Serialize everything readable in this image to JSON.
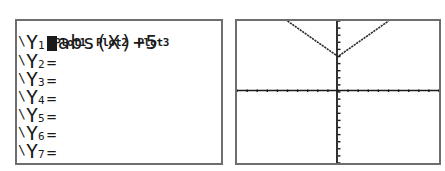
{
  "y_editor": {
    "plots": [
      "Plot1",
      "Plot2",
      "Plot3"
    ],
    "rows": [
      {
        "label": "Y",
        "sub": "1",
        "sign": "",
        "expr": "abs(X)+5",
        "selected": true
      },
      {
        "label": "Y",
        "sub": "2",
        "sign": "=",
        "expr": ""
      },
      {
        "label": "Y",
        "sub": "3",
        "sign": "=",
        "expr": ""
      },
      {
        "label": "Y",
        "sub": "4",
        "sign": "=",
        "expr": ""
      },
      {
        "label": "Y",
        "sub": "5",
        "sign": "=",
        "expr": ""
      },
      {
        "label": "Y",
        "sub": "6",
        "sign": "=",
        "expr": ""
      },
      {
        "label": "Y",
        "sub": "7",
        "sign": "=",
        "expr": ""
      }
    ]
  },
  "graph": {
    "function": "abs(X)+5",
    "window": {
      "xmin": -10,
      "xmax": 10,
      "ymin": -10,
      "ymax": 10,
      "xscl": 1,
      "yscl": 1
    },
    "colors": {
      "axis": "#1a1a1a",
      "curve": "#1a1a1a",
      "border": "#6e6e6e"
    }
  }
}
